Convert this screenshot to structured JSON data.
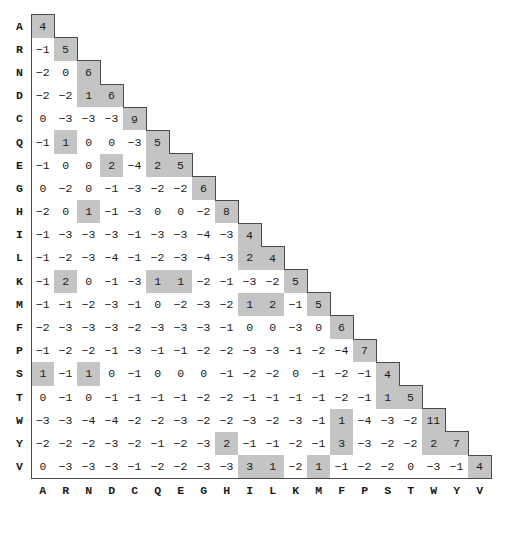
{
  "chart_data": {
    "type": "heatmap",
    "title": "",
    "subtitle": "",
    "xlabel": "",
    "ylabel": "",
    "form": "lower-triangular substitution matrix",
    "grid": false,
    "legend": "none",
    "categories": [
      "A",
      "R",
      "N",
      "D",
      "C",
      "Q",
      "E",
      "G",
      "H",
      "I",
      "L",
      "K",
      "M",
      "F",
      "P",
      "S",
      "T",
      "W",
      "Y",
      "V"
    ],
    "row_labels": [
      "A",
      "R",
      "N",
      "D",
      "C",
      "Q",
      "E",
      "G",
      "H",
      "I",
      "L",
      "K",
      "M",
      "F",
      "P",
      "S",
      "T",
      "W",
      "Y",
      "V"
    ],
    "column_labels": [
      "A",
      "R",
      "N",
      "D",
      "C",
      "Q",
      "E",
      "G",
      "H",
      "I",
      "L",
      "K",
      "M",
      "F",
      "P",
      "S",
      "T",
      "W",
      "Y",
      "V"
    ],
    "value_range": [
      -4,
      11
    ],
    "highlight_rule": "cells with value greater than or equal to 1 are shaded gray",
    "colors": {
      "shaded_cell": "#c4c4c4",
      "plain_cell": "#ffffff",
      "outline": "#4a4a4a",
      "text": "#1a1a1a",
      "label": "#000000",
      "background": "#ffffff"
    },
    "rows": [
      {
        "label": "A",
        "values": [
          4
        ]
      },
      {
        "label": "R",
        "values": [
          -1,
          5
        ]
      },
      {
        "label": "N",
        "values": [
          -2,
          0,
          6
        ]
      },
      {
        "label": "D",
        "values": [
          -2,
          -2,
          1,
          6
        ]
      },
      {
        "label": "C",
        "values": [
          0,
          -3,
          -3,
          -3,
          9
        ]
      },
      {
        "label": "Q",
        "values": [
          -1,
          1,
          0,
          0,
          -3,
          5
        ]
      },
      {
        "label": "E",
        "values": [
          -1,
          0,
          0,
          2,
          -4,
          2,
          5
        ]
      },
      {
        "label": "G",
        "values": [
          0,
          -2,
          0,
          -1,
          -3,
          -2,
          -2,
          6
        ]
      },
      {
        "label": "H",
        "values": [
          -2,
          0,
          1,
          -1,
          -3,
          0,
          0,
          -2,
          8
        ]
      },
      {
        "label": "I",
        "values": [
          -1,
          -3,
          -3,
          -3,
          -1,
          -3,
          -3,
          -4,
          -3,
          4
        ]
      },
      {
        "label": "L",
        "values": [
          -1,
          -2,
          -3,
          -4,
          -1,
          -2,
          -3,
          -4,
          -3,
          2,
          4
        ]
      },
      {
        "label": "K",
        "values": [
          -1,
          2,
          0,
          -1,
          -3,
          1,
          1,
          -2,
          -1,
          -3,
          -2,
          5
        ]
      },
      {
        "label": "M",
        "values": [
          -1,
          -1,
          -2,
          -3,
          -1,
          0,
          -2,
          -3,
          -2,
          1,
          2,
          -1,
          5
        ]
      },
      {
        "label": "F",
        "values": [
          -2,
          -3,
          -3,
          -3,
          -2,
          -3,
          -3,
          -3,
          -1,
          0,
          0,
          -3,
          0,
          6
        ]
      },
      {
        "label": "P",
        "values": [
          -1,
          -2,
          -2,
          -1,
          -3,
          -1,
          -1,
          -2,
          -2,
          -3,
          -3,
          -1,
          -2,
          -4,
          7
        ]
      },
      {
        "label": "S",
        "values": [
          1,
          -1,
          1,
          0,
          -1,
          0,
          0,
          0,
          -1,
          -2,
          -2,
          0,
          -1,
          -2,
          -1,
          4
        ]
      },
      {
        "label": "T",
        "values": [
          0,
          -1,
          0,
          -1,
          -1,
          -1,
          -1,
          -2,
          -2,
          -1,
          -1,
          -1,
          -1,
          -2,
          -1,
          1,
          5
        ]
      },
      {
        "label": "W",
        "values": [
          -3,
          -3,
          -4,
          -4,
          -2,
          -2,
          -3,
          -2,
          -2,
          -3,
          -2,
          -3,
          -1,
          1,
          -4,
          -3,
          -2,
          11
        ]
      },
      {
        "label": "Y",
        "values": [
          -2,
          -2,
          -2,
          -3,
          -2,
          -1,
          -2,
          -3,
          2,
          -1,
          -1,
          -2,
          -1,
          3,
          -3,
          -2,
          -2,
          2,
          7
        ]
      },
      {
        "label": "V",
        "values": [
          0,
          -3,
          -3,
          -3,
          -1,
          -2,
          -2,
          -3,
          -3,
          3,
          1,
          -2,
          1,
          -1,
          -2,
          -2,
          0,
          -3,
          -1,
          4
        ]
      }
    ]
  }
}
